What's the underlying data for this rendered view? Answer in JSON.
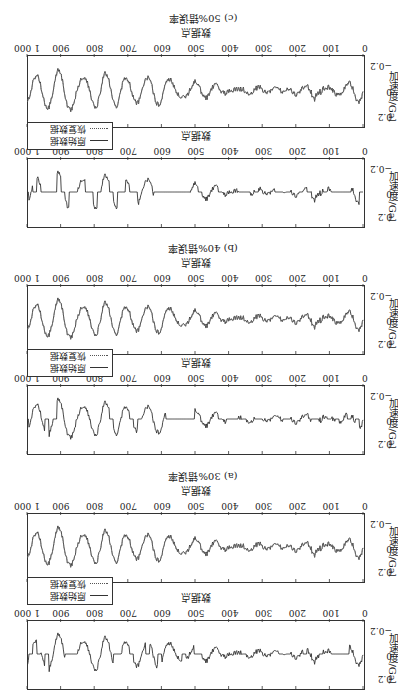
{
  "figure": {
    "rotation_deg": 180,
    "y_axis_label": "加速度/Gal",
    "x_axis_label": "数据点",
    "y_ticks": [
      "0.2",
      "0",
      "−0.2"
    ],
    "x_ticks": [
      "0",
      "100",
      "200",
      "300",
      "400",
      "500",
      "600",
      "700",
      "800",
      "900",
      "1 000"
    ],
    "legend": {
      "original": "原始数据",
      "recovered": "恢复数据"
    },
    "captions": {
      "a": "(a) 30%错误率",
      "b": "(b) 40%错误率",
      "c": "(c) 50%错误率"
    }
  },
  "chart_data": [
    {
      "type": "line",
      "panel": "a-damaged",
      "title": "(a) 30%错误率 — 受损数据",
      "xlabel": "数据点",
      "ylabel": "加速度/Gal",
      "xlim": [
        0,
        1000
      ],
      "ylim": [
        -0.25,
        0.25
      ],
      "x_ticks": [
        0,
        100,
        200,
        300,
        400,
        500,
        600,
        700,
        800,
        900,
        1000
      ],
      "y_ticks": [
        -0.2,
        0,
        0.2
      ],
      "series": [
        {
          "name": "原始数据(含30%缺失/置零)",
          "style": "solid",
          "missing_rate": 0.3
        }
      ]
    },
    {
      "type": "line",
      "panel": "a-recovered",
      "title": "(a) 30%错误率 — 恢复结果",
      "xlabel": "数据点",
      "ylabel": "加速度/Gal",
      "xlim": [
        0,
        1000
      ],
      "ylim": [
        -0.25,
        0.25
      ],
      "x_ticks": [
        0,
        100,
        200,
        300,
        400,
        500,
        600,
        700,
        800,
        900,
        1000
      ],
      "y_ticks": [
        -0.2,
        0,
        0.2
      ],
      "legend": [
        "原始数据",
        "恢复数据"
      ],
      "series": [
        {
          "name": "原始数据",
          "style": "solid"
        },
        {
          "name": "恢复数据",
          "style": "dotted"
        }
      ]
    },
    {
      "type": "line",
      "panel": "b-damaged",
      "title": "(b) 40%错误率 — 受损数据",
      "xlabel": "数据点",
      "ylabel": "加速度/Gal",
      "xlim": [
        0,
        1000
      ],
      "ylim": [
        -0.25,
        0.25
      ],
      "x_ticks": [
        0,
        100,
        200,
        300,
        400,
        500,
        600,
        700,
        800,
        900,
        1000
      ],
      "y_ticks": [
        -0.2,
        0,
        0.2
      ],
      "series": [
        {
          "name": "原始数据(含40%缺失/置零)",
          "style": "solid",
          "missing_rate": 0.4
        }
      ]
    },
    {
      "type": "line",
      "panel": "b-recovered",
      "title": "(b) 40%错误率 — 恢复结果",
      "xlabel": "数据点",
      "ylabel": "加速度/Gal",
      "xlim": [
        0,
        1000
      ],
      "ylim": [
        -0.25,
        0.25
      ],
      "x_ticks": [
        0,
        100,
        200,
        300,
        400,
        500,
        600,
        700,
        800,
        900,
        1000
      ],
      "y_ticks": [
        -0.2,
        0,
        0.2
      ],
      "legend": [
        "原始数据",
        "恢复数据"
      ],
      "series": [
        {
          "name": "原始数据",
          "style": "solid"
        },
        {
          "name": "恢复数据",
          "style": "dotted"
        }
      ]
    },
    {
      "type": "line",
      "panel": "c-damaged",
      "title": "(c) 50%错误率 — 受损数据",
      "xlabel": "数据点",
      "ylabel": "加速度/Gal",
      "xlim": [
        0,
        1000
      ],
      "ylim": [
        -0.25,
        0.25
      ],
      "x_ticks": [
        0,
        100,
        200,
        300,
        400,
        500,
        600,
        700,
        800,
        900,
        1000
      ],
      "y_ticks": [
        -0.2,
        0,
        0.2
      ],
      "series": [
        {
          "name": "原始数据(含50%缺失/置零)",
          "style": "solid",
          "missing_rate": 0.5
        }
      ]
    },
    {
      "type": "line",
      "panel": "c-recovered",
      "title": "(c) 50%错误率 — 恢复结果",
      "xlabel": "数据点",
      "ylabel": "加速度/Gal",
      "xlim": [
        0,
        1000
      ],
      "ylim": [
        -0.25,
        0.25
      ],
      "x_ticks": [
        0,
        100,
        200,
        300,
        400,
        500,
        600,
        700,
        800,
        900,
        1000
      ],
      "y_ticks": [
        -0.2,
        0,
        0.2
      ],
      "legend": [
        "原始数据",
        "恢复数据"
      ],
      "series": [
        {
          "name": "原始数据",
          "style": "solid"
        },
        {
          "name": "恢复数据",
          "style": "dotted"
        }
      ]
    }
  ]
}
